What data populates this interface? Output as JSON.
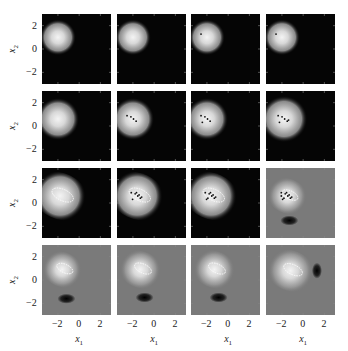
{
  "chart_data": {
    "type": "heatmap",
    "title": "",
    "grid": {
      "rows": 4,
      "cols": 4
    },
    "xlabel": "x1",
    "ylabel": "x2",
    "xlim": [
      -3.5,
      3
    ],
    "ylim": [
      -3,
      3
    ],
    "xticks": [
      -2,
      0,
      2
    ],
    "yticks": [
      -2,
      0,
      2
    ],
    "xtick_labels": [
      "−2",
      "0",
      "2"
    ],
    "ytick_labels": [
      "2",
      "0",
      "−2"
    ],
    "colormap": "grayscale",
    "panels": [
      {
        "row": 0,
        "col": 0,
        "background": "black",
        "blob_center": [
          -2.0,
          1.0
        ],
        "blob_radius": 1.7,
        "samples": 0,
        "dark_spot": null
      },
      {
        "row": 0,
        "col": 1,
        "background": "black",
        "blob_center": [
          -2.0,
          1.0
        ],
        "blob_radius": 1.7,
        "samples": 0,
        "dark_spot": null
      },
      {
        "row": 0,
        "col": 2,
        "background": "black",
        "blob_center": [
          -2.0,
          1.0
        ],
        "blob_radius": 1.7,
        "samples": 1,
        "dark_spot": null
      },
      {
        "row": 0,
        "col": 3,
        "background": "black",
        "blob_center": [
          -2.0,
          1.0
        ],
        "blob_radius": 1.7,
        "samples": 1,
        "dark_spot": null
      },
      {
        "row": 1,
        "col": 0,
        "background": "black",
        "blob_center": [
          -2.0,
          0.6
        ],
        "blob_radius": 2.0,
        "samples": 0,
        "dark_spot": null
      },
      {
        "row": 1,
        "col": 1,
        "background": "black",
        "blob_center": [
          -2.0,
          0.6
        ],
        "blob_radius": 2.0,
        "samples": 4,
        "dark_spot": null
      },
      {
        "row": 1,
        "col": 2,
        "background": "black",
        "blob_center": [
          -2.0,
          0.6
        ],
        "blob_radius": 2.0,
        "samples": 5,
        "dark_spot": null
      },
      {
        "row": 1,
        "col": 3,
        "background": "black",
        "blob_center": [
          -1.8,
          0.6
        ],
        "blob_radius": 2.2,
        "samples": 6,
        "dark_spot": null
      },
      {
        "row": 2,
        "col": 0,
        "background": "black",
        "blob_center": [
          -1.8,
          0.6
        ],
        "blob_radius": 2.4,
        "samples": 0,
        "dark_spot": null
      },
      {
        "row": 2,
        "col": 1,
        "background": "black",
        "blob_center": [
          -1.6,
          0.6
        ],
        "blob_radius": 2.4,
        "samples": 8,
        "dark_spot": null
      },
      {
        "row": 2,
        "col": 2,
        "background": "black",
        "blob_center": [
          -1.6,
          0.6
        ],
        "blob_radius": 2.4,
        "samples": 9,
        "dark_spot": null
      },
      {
        "row": 2,
        "col": 3,
        "background": "gray",
        "blob_center": [
          -1.5,
          0.6
        ],
        "blob_radius": 1.8,
        "samples": 10,
        "dark_spot": [
          -1.3,
          -1.5
        ]
      },
      {
        "row": 3,
        "col": 0,
        "background": "gray",
        "blob_center": [
          -1.6,
          0.9
        ],
        "blob_radius": 1.8,
        "samples": 0,
        "dark_spot": [
          -1.2,
          -1.6
        ]
      },
      {
        "row": 3,
        "col": 1,
        "background": "gray",
        "blob_center": [
          -1.3,
          0.9
        ],
        "blob_radius": 1.9,
        "samples": 0,
        "dark_spot": [
          -0.9,
          -1.5
        ]
      },
      {
        "row": 3,
        "col": 2,
        "background": "gray",
        "blob_center": [
          -1.3,
          0.9
        ],
        "blob_radius": 1.9,
        "samples": 0,
        "dark_spot": [
          -0.9,
          -1.5
        ]
      },
      {
        "row": 3,
        "col": 3,
        "background": "gray",
        "blob_center": [
          -1.2,
          0.8
        ],
        "blob_radius": 2.1,
        "samples": 0,
        "dark_spot": [
          1.3,
          0.8
        ]
      }
    ]
  },
  "axes": {
    "ylabel": "x",
    "ylabel_sub": "2",
    "xlabel": "x",
    "xlabel_sub": "1",
    "yticks": [
      "2",
      "0",
      "−2"
    ],
    "xticks": [
      "−2",
      "0",
      "2"
    ]
  }
}
